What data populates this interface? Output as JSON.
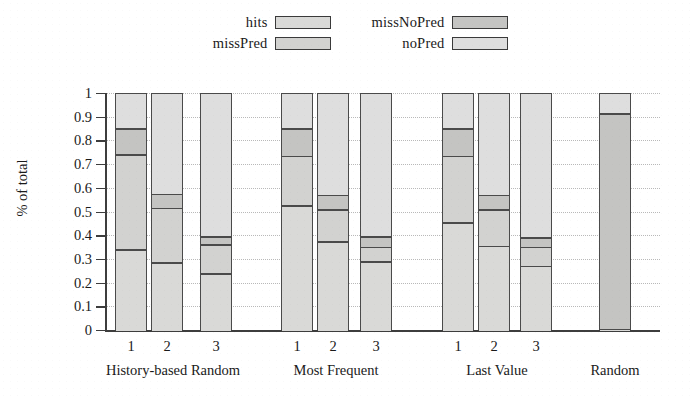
{
  "chart_data": {
    "type": "bar",
    "subtype": "stacked-bar",
    "title": "",
    "xlabel": "",
    "ylabel": "% of total",
    "ylim": [
      0,
      1
    ],
    "ytick_labels": [
      "0",
      "0.1",
      "0.2",
      "0.3",
      "0.4",
      "0.5",
      "0.6",
      "0.7",
      "0.8",
      "0.9",
      "1"
    ],
    "ytick_values": [
      0,
      0.1,
      0.2,
      0.3,
      0.4,
      0.5,
      0.6,
      0.7,
      0.8,
      0.9,
      1
    ],
    "grid": true,
    "grid_axis": "y",
    "legend_position": "top-center",
    "legend": [
      "hits",
      "missNoPred",
      "missPred",
      "noPred"
    ],
    "series": [
      {
        "name": "hits",
        "color": "#d9d9d7",
        "values": [
          0.345,
          0.29,
          0.245,
          0.53,
          0.38,
          0.295,
          0.46,
          0.36,
          0.275,
          0.01
        ]
      },
      {
        "name": "missPred",
        "color": "#d2d2d0",
        "values": [
          0.4,
          0.23,
          0.12,
          0.21,
          0.135,
          0.06,
          0.28,
          0.155,
          0.08,
          0.0
        ]
      },
      {
        "name": "missNoPred",
        "color": "#c4c4c2",
        "values": [
          0.11,
          0.06,
          0.035,
          0.115,
          0.06,
          0.045,
          0.115,
          0.06,
          0.04,
          0.91
        ]
      },
      {
        "name": "noPred",
        "color": "#dedede",
        "values": [
          0.145,
          0.42,
          0.6,
          0.145,
          0.425,
          0.6,
          0.145,
          0.425,
          0.605,
          0.08
        ]
      }
    ],
    "groups": [
      {
        "label": "History-based Random",
        "bars": [
          "1",
          "2",
          "3"
        ]
      },
      {
        "label": "Most Frequent",
        "bars": [
          "1",
          "2",
          "3"
        ]
      },
      {
        "label": "Last Value",
        "bars": [
          "1",
          "2",
          "3"
        ]
      },
      {
        "label": "Random",
        "bars": [
          ""
        ]
      }
    ],
    "bars": [
      {
        "group": "History-based Random",
        "label": "1",
        "boundaries": [
          0,
          0.345,
          0.745,
          0.855,
          1
        ]
      },
      {
        "group": "History-based Random",
        "label": "2",
        "boundaries": [
          0,
          0.29,
          0.52,
          0.58,
          1
        ]
      },
      {
        "group": "History-based Random",
        "label": "3",
        "boundaries": [
          0,
          0.245,
          0.365,
          0.4,
          1
        ]
      },
      {
        "group": "Most Frequent",
        "label": "1",
        "boundaries": [
          0,
          0.53,
          0.74,
          0.855,
          1
        ]
      },
      {
        "group": "Most Frequent",
        "label": "2",
        "boundaries": [
          0,
          0.38,
          0.515,
          0.575,
          1
        ]
      },
      {
        "group": "Most Frequent",
        "label": "3",
        "boundaries": [
          0,
          0.295,
          0.355,
          0.4,
          1
        ]
      },
      {
        "group": "Last Value",
        "label": "1",
        "boundaries": [
          0,
          0.46,
          0.74,
          0.855,
          1
        ]
      },
      {
        "group": "Last Value",
        "label": "2",
        "boundaries": [
          0,
          0.36,
          0.515,
          0.575,
          1
        ]
      },
      {
        "group": "Last Value",
        "label": "3",
        "boundaries": [
          0,
          0.275,
          0.355,
          0.395,
          1
        ]
      },
      {
        "group": "Random",
        "label": "",
        "boundaries": [
          0,
          0.01,
          0.01,
          0.92,
          1
        ]
      }
    ],
    "colors": {
      "hits": "#d9d9d7",
      "missPred": "#d2d2d0",
      "missNoPred": "#c4c4c2",
      "noPred": "#dedede",
      "axis": "#3d3d3d",
      "grid": "#b9b9b9",
      "background": "#ffffff"
    }
  },
  "legend": {
    "items": [
      {
        "label": "hits",
        "swatch": "#d9d9d7"
      },
      {
        "label": "missNoPred",
        "swatch": "#c4c4c2"
      },
      {
        "label": "missPred",
        "swatch": "#d2d2d0"
      },
      {
        "label": "noPred",
        "swatch": "#dedede"
      }
    ]
  },
  "axis": {
    "y_title": "% of total"
  }
}
